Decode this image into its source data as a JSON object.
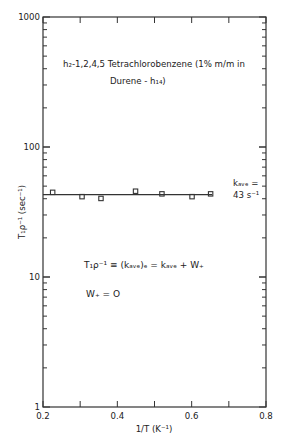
{
  "chart_data": {
    "type": "scatter",
    "title_lines": [
      "h₂-1,2,4,5 Tetrachlorobenzene (1% m/m in",
      "Durene - h₁₄)"
    ],
    "xlabel": "1/T (K⁻¹)",
    "ylabel": "T₁ρ⁻¹ (sec⁻¹)",
    "xlim": [
      0.2,
      0.8
    ],
    "ylim": [
      1,
      1000
    ],
    "yscale": "log",
    "x_ticks": [
      "0.2",
      "0.4",
      "0.6",
      "0.8"
    ],
    "y_ticks": [
      "1",
      "10",
      "100",
      "1000"
    ],
    "grid": false,
    "series": [
      {
        "name": "data",
        "marker": "square",
        "x": [
          0.226,
          0.305,
          0.356,
          0.449,
          0.52,
          0.601,
          0.651
        ],
        "y": [
          44.8,
          41.5,
          40.2,
          45.7,
          43.6,
          41.5,
          43.6
        ]
      },
      {
        "name": "k_ave fit",
        "type": "line",
        "x": [
          0.2,
          0.655
        ],
        "y": [
          43,
          43
        ]
      }
    ],
    "annotations": {
      "kave_label_1": "kₐᵥₑ =",
      "kave_label_2": "43 s⁻¹",
      "equation_1": "T₁ρ⁻¹ ≡ (kₐᵥₑ)ₑ = kₐᵥₑ + W₊",
      "equation_2": "W₊ = O"
    }
  }
}
